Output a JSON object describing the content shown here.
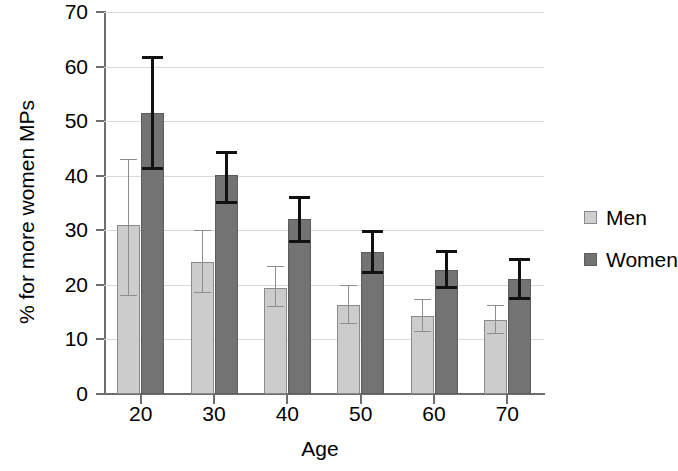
{
  "chart_data": {
    "type": "bar",
    "title": "",
    "xlabel": "Age",
    "ylabel": "% for more women MPs",
    "categories": [
      "20",
      "30",
      "40",
      "50",
      "60",
      "70"
    ],
    "ylim": [
      0,
      70
    ],
    "yticks": [
      0,
      10,
      20,
      30,
      40,
      50,
      60,
      70
    ],
    "ytick_labels": [
      "0",
      "10",
      "20",
      "30",
      "40",
      "50",
      "60",
      "70"
    ],
    "grid": true,
    "legend_position": "right",
    "series": [
      {
        "name": "Men",
        "color": "#cccccc",
        "values": [
          31.0,
          24.2,
          19.5,
          16.4,
          14.3,
          13.5
        ],
        "err_low": [
          18.0,
          18.5,
          16.0,
          12.9,
          11.4,
          11.0
        ],
        "err_high": [
          43.0,
          30.0,
          23.4,
          20.0,
          17.5,
          16.3
        ]
      },
      {
        "name": "Women",
        "color": "#737373",
        "values": [
          51.5,
          40.1,
          32.0,
          26.0,
          22.8,
          21.0
        ],
        "err_low": [
          41.0,
          34.8,
          27.7,
          22.0,
          19.3,
          17.3
        ],
        "err_high": [
          62.0,
          44.5,
          36.2,
          30.0,
          26.3,
          25.0
        ]
      }
    ]
  },
  "legend": {
    "items": [
      {
        "label": "Men"
      },
      {
        "label": "Women"
      }
    ]
  }
}
